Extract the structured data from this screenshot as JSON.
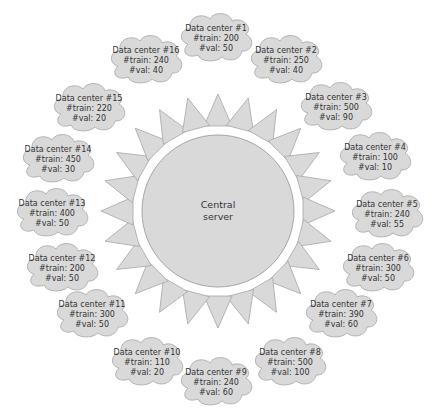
{
  "colors": {
    "shape_fill": "#d9d9d9",
    "shape_stroke": "#a6a6a6",
    "text": "#333333",
    "background": "#ffffff"
  },
  "central_server": {
    "label_line1": "Central",
    "label_line2": "server",
    "cx": 218,
    "cy": 211,
    "r": 76
  },
  "rays": {
    "count": 24,
    "inner_r": 85,
    "outer_r": 117,
    "half_width": 14
  },
  "data_centers": [
    {
      "name": "Data center #1",
      "train_label": "#train: 200",
      "val_label": "#val: 50",
      "train": 200,
      "val": 50,
      "x": 216,
      "y": 38
    },
    {
      "name": "Data center #2",
      "train_label": "#train: 250",
      "val_label": "#val: 40",
      "train": 250,
      "val": 40,
      "x": 286,
      "y": 60
    },
    {
      "name": "Data center #3",
      "train_label": "#train: 500",
      "val_label": "#val: 90",
      "train": 500,
      "val": 90,
      "x": 336,
      "y": 107
    },
    {
      "name": "Data center #4",
      "train_label": "#train: 100",
      "val_label": "#val: 10",
      "train": 100,
      "val": 10,
      "x": 375,
      "y": 157
    },
    {
      "name": "Data center #5",
      "train_label": "#train: 240",
      "val_label": "#val: 55",
      "train": 240,
      "val": 55,
      "x": 387,
      "y": 214
    },
    {
      "name": "Data center #6",
      "train_label": "#train: 300",
      "val_label": "#val: 50",
      "train": 300,
      "val": 50,
      "x": 378,
      "y": 268
    },
    {
      "name": "Data center #7",
      "train_label": "#train: 390",
      "val_label": "#val: 60",
      "train": 390,
      "val": 60,
      "x": 341,
      "y": 314
    },
    {
      "name": "Data center #8",
      "train_label": "#train: 500",
      "val_label": "#val: 100",
      "train": 500,
      "val": 100,
      "x": 290,
      "y": 362
    },
    {
      "name": "Data center #9",
      "train_label": "#train: 240",
      "val_label": "#val: 60",
      "train": 240,
      "val": 60,
      "x": 216,
      "y": 382
    },
    {
      "name": "Data center #10",
      "train_label": "#train: 110",
      "val_label": "#val: 20",
      "train": 110,
      "val": 20,
      "x": 147,
      "y": 362
    },
    {
      "name": "Data center #11",
      "train_label": "#train: 300",
      "val_label": "#val: 50",
      "train": 300,
      "val": 50,
      "x": 92,
      "y": 314
    },
    {
      "name": "Data center #12",
      "train_label": "#train: 200",
      "val_label": "#val: 50",
      "train": 200,
      "val": 50,
      "x": 62,
      "y": 268
    },
    {
      "name": "Data center #13",
      "train_label": "#train: 400",
      "val_label": "#val: 50",
      "train": 400,
      "val": 50,
      "x": 52,
      "y": 213
    },
    {
      "name": "Data center #14",
      "train_label": "#train: 450",
      "val_label": "#val: 30",
      "train": 450,
      "val": 30,
      "x": 58,
      "y": 159
    },
    {
      "name": "Data center #15",
      "train_label": "#train: 220",
      "val_label": "#val: 20",
      "train": 220,
      "val": 20,
      "x": 89,
      "y": 108
    },
    {
      "name": "Data center #16",
      "train_label": "#train: 240",
      "val_label": "#val: 40",
      "train": 240,
      "val": 40,
      "x": 146,
      "y": 60
    }
  ]
}
